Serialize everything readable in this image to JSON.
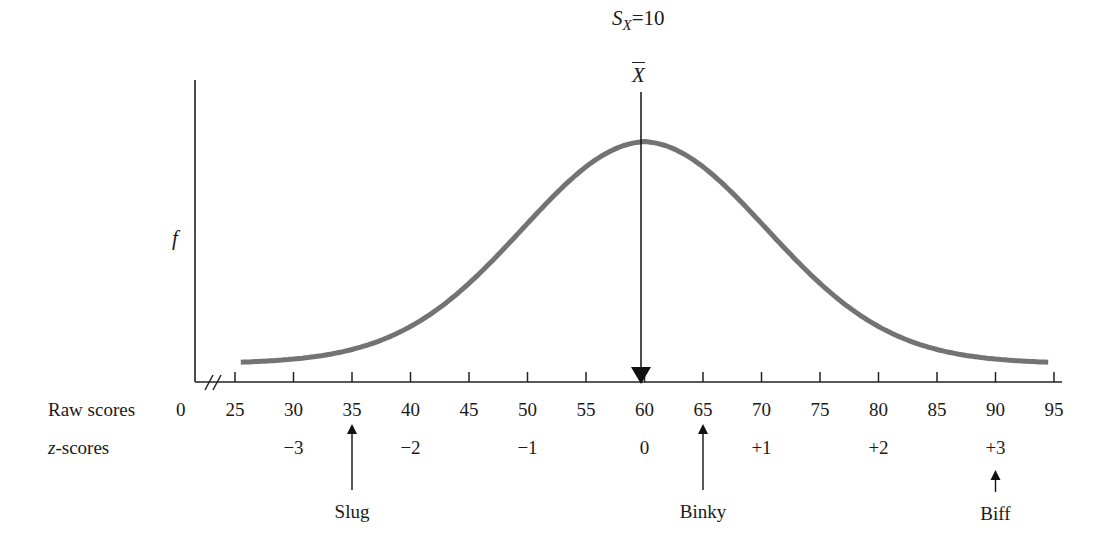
{
  "chart_data": {
    "type": "line",
    "title": "",
    "ylabel": "f",
    "xlabel": "",
    "annotation_sd": "S",
    "annotation_sd_sub": "X",
    "annotation_sd_value": "=10",
    "annotation_mean": "X",
    "mean": 60,
    "sd": 10,
    "raw_label": "Raw scores",
    "z_label_prefix": "z",
    "z_label_suffix": "-scores",
    "raw_zero": "0",
    "raw_ticks": [
      "25",
      "30",
      "35",
      "40",
      "45",
      "50",
      "55",
      "60",
      "65",
      "70",
      "75",
      "80",
      "85",
      "90",
      "95"
    ],
    "z_ticks": [
      {
        "raw": 30,
        "label": "−3"
      },
      {
        "raw": 40,
        "label": "−2"
      },
      {
        "raw": 50,
        "label": "−1"
      },
      {
        "raw": 60,
        "label": "0"
      },
      {
        "raw": 70,
        "label": "+1"
      },
      {
        "raw": 80,
        "label": "+2"
      },
      {
        "raw": 90,
        "label": "+3"
      }
    ],
    "markers": [
      {
        "name": "Slug",
        "raw": 35
      },
      {
        "name": "Binky",
        "raw": 65
      },
      {
        "name": "Biff",
        "raw": 90
      }
    ],
    "xlim": [
      25,
      95
    ],
    "axis_break": true,
    "grid": false,
    "curve_color": "#737373"
  }
}
